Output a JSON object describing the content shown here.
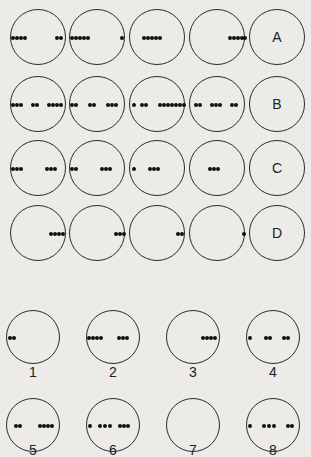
{
  "colors": {
    "background": "#ecebe8",
    "stroke": "#2a2a2a",
    "dot": "#111111"
  },
  "grid": {
    "rows": [
      {
        "label": "A",
        "cy": 37,
        "cells": [
          {
            "dots": [
              -26,
              -22,
              -18,
              -14,
              18,
              22
            ]
          },
          {
            "dots": [
              -26,
              -22,
              -18,
              -14,
              -10,
              24
            ]
          },
          {
            "dots": [
              -14,
              -10,
              -6,
              -2,
              2
            ]
          },
          {
            "dots": [
              12,
              16,
              20,
              24,
              27
            ]
          }
        ]
      },
      {
        "label": "B",
        "cy": 104,
        "cells": [
          {
            "dots": [
              -26,
              -22,
              -18,
              -6,
              -2,
              10,
              14,
              18,
              22
            ]
          },
          {
            "dots": [
              -26,
              -22,
              -8,
              -4,
              10,
              14,
              18
            ]
          },
          {
            "dots": [
              -24,
              -16,
              -12,
              2,
              6,
              10,
              14,
              18,
              22,
              26
            ]
          },
          {
            "dots": [
              -22,
              -18,
              -6,
              -2,
              2,
              14,
              18
            ]
          }
        ]
      },
      {
        "label": "C",
        "cy": 168,
        "cells": [
          {
            "dots": [
              -26,
              -22,
              -18,
              8,
              12,
              16
            ]
          },
          {
            "dots": [
              -26,
              -22,
              4,
              8,
              12
            ]
          },
          {
            "dots": [
              -24,
              -8,
              -4,
              0
            ]
          },
          {
            "dots": [
              -8,
              -4,
              0
            ]
          }
        ]
      },
      {
        "label": "D",
        "cy": 233,
        "cells": [
          {
            "dots": [
              12,
              16,
              20,
              24
            ]
          },
          {
            "dots": [
              18,
              22,
              26
            ]
          },
          {
            "dots": [
              20,
              24
            ]
          },
          {
            "dots": [
              26
            ]
          }
        ]
      }
    ],
    "col_cx": [
      38,
      97,
      157,
      217,
      277
    ],
    "radius": 28
  },
  "options": {
    "radius": 27,
    "items": [
      {
        "number": "1",
        "cx": 33,
        "cy": 337,
        "label_y": 364,
        "dots": [
          -24,
          -20
        ]
      },
      {
        "number": "2",
        "cx": 113,
        "cy": 337,
        "label_y": 364,
        "dots": [
          -25,
          -21,
          -17,
          -13,
          5,
          9,
          13
        ]
      },
      {
        "number": "3",
        "cx": 193,
        "cy": 337,
        "label_y": 364,
        "dots": [
          9,
          13,
          17,
          21
        ]
      },
      {
        "number": "4",
        "cx": 273,
        "cy": 337,
        "label_y": 364,
        "dots": [
          -24,
          -8,
          -4,
          10,
          14
        ]
      },
      {
        "number": "5",
        "cx": 33,
        "cy": 425,
        "label_y": 442,
        "dots": [
          -18,
          -14,
          6,
          10,
          14,
          18
        ]
      },
      {
        "number": "6",
        "cx": 113,
        "cy": 425,
        "label_y": 442,
        "dots": [
          -24,
          -14,
          -9,
          -4,
          6,
          10,
          14
        ]
      },
      {
        "number": "7",
        "cx": 193,
        "cy": 425,
        "label_y": 442,
        "dots": []
      },
      {
        "number": "8",
        "cx": 273,
        "cy": 425,
        "label_y": 442,
        "dots": [
          -24,
          -10,
          -5,
          0,
          14,
          18
        ]
      }
    ]
  }
}
